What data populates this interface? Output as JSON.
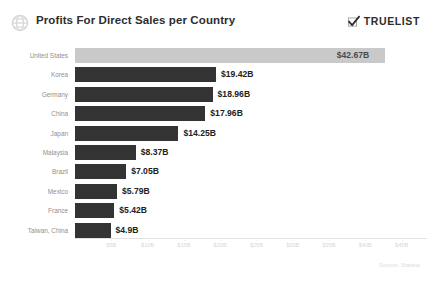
{
  "header": {
    "title": "Profits For Direct Sales per Country",
    "logo_icon": "globe-icon",
    "brand": {
      "wordmark": "TRUELIST",
      "icon": "check-mark-icon"
    }
  },
  "footer": {
    "source": "Source: Statista"
  },
  "colors": {
    "bar": "#333333",
    "bar_highlight": "#c9c9c9",
    "title_text": "#2d2d2d",
    "category_text": "#8f8f8f",
    "value_text": "#222222",
    "tick_text": "#d8d8d8",
    "background": "#ffffff"
  },
  "chart_data": {
    "type": "bar",
    "orientation": "horizontal",
    "title": "Profits For Direct Sales per Country",
    "xlabel": "",
    "ylabel": "",
    "grid": false,
    "legend": null,
    "xlim": [
      0,
      48.5
    ],
    "unit": "B",
    "currency": "$",
    "categories": [
      "United States",
      "Korea",
      "Germany",
      "China",
      "Japan",
      "Malaysia",
      "Brazil",
      "Mexico",
      "France",
      "Taiwan, China"
    ],
    "values": [
      42.67,
      19.42,
      18.96,
      17.96,
      14.25,
      8.37,
      7.05,
      5.79,
      5.42,
      4.9
    ],
    "value_labels": [
      "$42.67B",
      "$19.42B",
      "$18.96B",
      "$17.96B",
      "$14.25B",
      "$8.37B",
      "$7.05B",
      "$5.79B",
      "$5.42B",
      "$4.9B"
    ],
    "label_placement": [
      "inside",
      "outside",
      "outside",
      "outside",
      "outside",
      "outside",
      "outside",
      "outside",
      "outside",
      "outside"
    ],
    "highlight_index": 0,
    "xticks": [
      5,
      10,
      15,
      20,
      25,
      30,
      35,
      40,
      45
    ],
    "xtick_labels": [
      "$5B",
      "$10B",
      "$15B",
      "$20B",
      "$25B",
      "$30B",
      "$35B",
      "$40B",
      "$45B"
    ]
  }
}
